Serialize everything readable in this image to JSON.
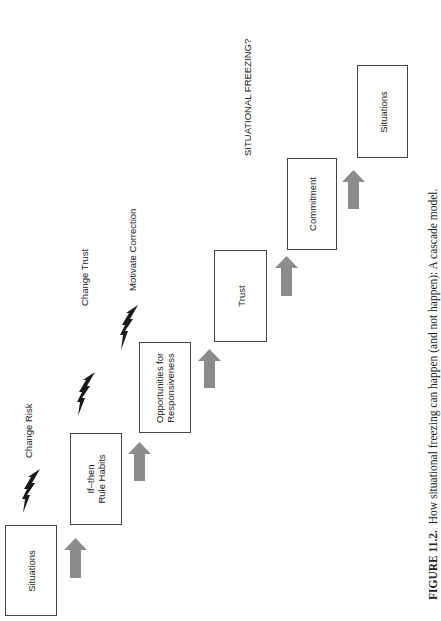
{
  "figure": {
    "caption_label": "FIGURE 11.2.",
    "caption_text": "How situational freezing can happen (and not happen):  A cascade model.",
    "header_note": "SITUATIONAL FREEZING?",
    "colors": {
      "arrow": "#8c8c8c",
      "bolt": "#1a1a1a",
      "box_border": "#444444"
    }
  },
  "boxes": [
    {
      "label_line1": "Situations",
      "label_line2": ""
    },
    {
      "label_line1": "If–then",
      "label_line2": "Rule Habits"
    },
    {
      "label_line1": "Opportunities for",
      "label_line2": "Responsiveness"
    },
    {
      "label_line1": "Trust",
      "label_line2": ""
    },
    {
      "label_line1": "Commitment",
      "label_line2": ""
    },
    {
      "label_line1": "Situations",
      "label_line2": ""
    }
  ],
  "interventions": [
    {
      "label": "Change Risk",
      "icon": "lightning-bolt-icon"
    },
    {
      "label": "Change Trust",
      "icon": "lightning-bolt-icon"
    },
    {
      "label": "Motivate Correction",
      "icon": "lightning-bolt-icon"
    }
  ],
  "arrows": [
    {
      "icon": "arrow-up-icon"
    },
    {
      "icon": "arrow-up-icon"
    },
    {
      "icon": "arrow-up-icon"
    },
    {
      "icon": "arrow-up-icon"
    },
    {
      "icon": "arrow-up-icon"
    }
  ]
}
